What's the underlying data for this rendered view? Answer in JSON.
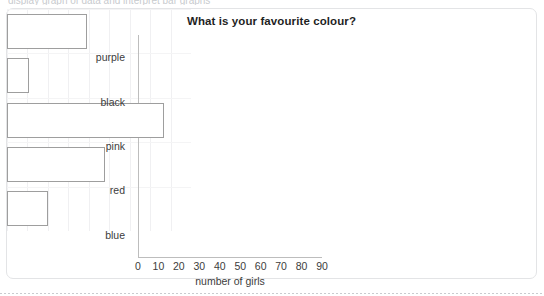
{
  "page": {
    "top_clipped_text": "display graph of data and interpret bar graphs"
  },
  "card": {
    "title": "What is your favourite colour?"
  },
  "chart_data": {
    "type": "bar",
    "orientation": "horizontal",
    "title": "What is your favourite colour?",
    "xlabel": "number of girls",
    "ylabel": "",
    "categories": [
      "purple",
      "black",
      "pink",
      "red",
      "blue"
    ],
    "values": [
      39,
      11,
      77,
      48,
      20
    ],
    "xlim": [
      0,
      90
    ],
    "xticks": [
      "0",
      "10",
      "20",
      "30",
      "40",
      "50",
      "60",
      "70",
      "80",
      "90"
    ],
    "xtick_values": [
      0,
      10,
      20,
      30,
      40,
      50,
      60,
      70,
      80,
      90
    ],
    "grid": true,
    "legend": "none",
    "bar_fill": "#ffffff",
    "bar_border": "#9e9e9e",
    "axis_color": "#bdbdbd",
    "text_color": "#3c3c3c"
  }
}
